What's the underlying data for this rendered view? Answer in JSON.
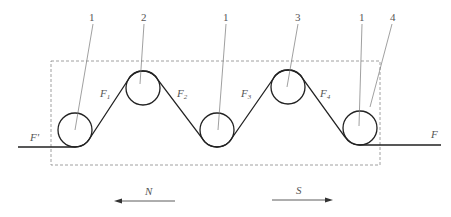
{
  "diagram": {
    "type": "roller-tension-schematic",
    "frame": {
      "x": 51,
      "y": 61,
      "width": 329,
      "height": 104,
      "style": "dashed"
    },
    "rollers": [
      {
        "id": "roller-1a",
        "label": "1",
        "cx": 75,
        "cy": 130,
        "r": 17
      },
      {
        "id": "roller-2",
        "label": "2",
        "cx": 143,
        "cy": 88,
        "r": 17
      },
      {
        "id": "roller-1b",
        "label": "1",
        "cx": 217,
        "cy": 130,
        "r": 17
      },
      {
        "id": "roller-3",
        "label": "3",
        "cx": 288,
        "cy": 87,
        "r": 17
      },
      {
        "id": "roller-1c",
        "label": "1",
        "cx": 360,
        "cy": 128,
        "r": 17
      }
    ],
    "callouts": [
      {
        "text": "1",
        "tx": 92,
        "ty": 18,
        "x1": 93,
        "y1": 24,
        "x2": 75,
        "y2": 130
      },
      {
        "text": "2",
        "tx": 143,
        "ty": 18,
        "x1": 144,
        "y1": 24,
        "x2": 140,
        "y2": 84
      },
      {
        "text": "1",
        "tx": 224,
        "ty": 18,
        "x1": 226,
        "y1": 24,
        "x2": 218,
        "y2": 130
      },
      {
        "text": "3",
        "tx": 297,
        "ty": 18,
        "x1": 298,
        "y1": 24,
        "x2": 287,
        "y2": 87
      },
      {
        "text": "1",
        "tx": 361,
        "ty": 18,
        "x1": 362,
        "y1": 24,
        "x2": 359,
        "y2": 126
      },
      {
        "text": "4",
        "tx": 393,
        "ty": 18,
        "x1": 392,
        "y1": 24,
        "x2": 370,
        "y2": 107
      }
    ],
    "forces": {
      "F_in": {
        "text": "F'",
        "x": 31,
        "y": 141
      },
      "F1": {
        "base": "F",
        "sub": "1",
        "x": 101,
        "y": 95
      },
      "F2": {
        "base": "F",
        "sub": "2",
        "x": 180,
        "y": 95
      },
      "F3": {
        "base": "F",
        "sub": "3",
        "x": 242,
        "y": 95
      },
      "F4": {
        "base": "F",
        "sub": "4",
        "x": 321,
        "y": 95
      },
      "F_out": {
        "text": "F",
        "x": 432,
        "y": 137
      }
    },
    "directions": {
      "N": {
        "label": "N",
        "x1": 175,
        "x2": 115,
        "y": 201,
        "lx": 147,
        "ly": 193
      },
      "S": {
        "label": "S",
        "x1": 272,
        "x2": 333,
        "y": 200,
        "lx": 297,
        "ly": 192
      }
    },
    "colors": {
      "line": "#222222",
      "leader": "#777777",
      "frame": "#888888",
      "text": "#555555"
    }
  }
}
